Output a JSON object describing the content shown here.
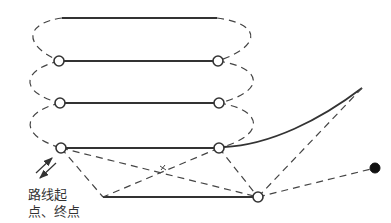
{
  "diagram": {
    "label_line1": "路线起",
    "label_line2": "点、终点",
    "top_cut_text": "",
    "colors": {
      "line": "#333333",
      "background": "#ffffff",
      "filled_node": "#111111"
    },
    "nodes": [
      {
        "id": "L1",
        "x": 59,
        "y": 61,
        "type": "open"
      },
      {
        "id": "R1",
        "x": 218,
        "y": 61,
        "type": "open"
      },
      {
        "id": "L2",
        "x": 60,
        "y": 103,
        "type": "open"
      },
      {
        "id": "R2",
        "x": 219,
        "y": 103,
        "type": "open"
      },
      {
        "id": "L3",
        "x": 61,
        "y": 148,
        "type": "open"
      },
      {
        "id": "R3",
        "x": 219,
        "y": 148,
        "type": "open"
      },
      {
        "id": "B",
        "x": 258,
        "y": 197,
        "type": "open"
      },
      {
        "id": "D",
        "x": 375,
        "y": 168,
        "type": "filled"
      }
    ],
    "solid_segments": [
      {
        "from": "top-left",
        "to": "top-right",
        "y": 18
      },
      {
        "from": "L1",
        "to": "R1"
      },
      {
        "from": "L2",
        "to": "R2"
      },
      {
        "from": "L3",
        "to": "R3"
      },
      {
        "from": "bottom-left",
        "to": "B"
      },
      {
        "from": "R3",
        "to": "curve-end",
        "type": "curve"
      }
    ]
  }
}
